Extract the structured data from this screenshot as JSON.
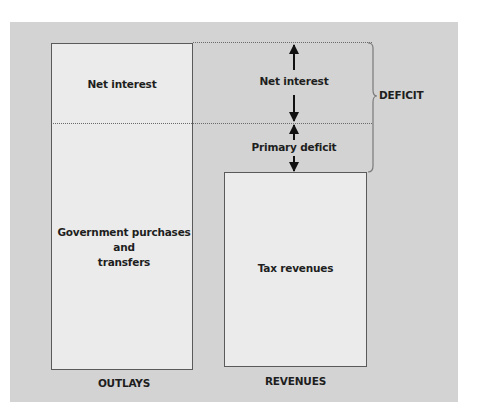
{
  "diagram": {
    "colors": {
      "panel_background": "#d3d3d3",
      "box_fill": "#ebebeb",
      "box_border": "#5a5a5a",
      "text": "#1e1e1e",
      "arrow": "#111111"
    },
    "outlays": {
      "caption": "OUTLAYS",
      "top_segment_label": "Net interest",
      "bottom_segment_label_lines": [
        "Government purchases",
        "and",
        "transfers"
      ]
    },
    "revenues": {
      "caption": "REVENUES",
      "box_label": "Tax revenues"
    },
    "gap": {
      "upper_arrow_label": "Net interest",
      "lower_arrow_label": "Primary deficit",
      "brace_label": "DEFICIT"
    }
  }
}
